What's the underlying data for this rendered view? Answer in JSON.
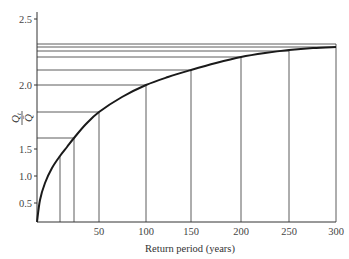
{
  "chart_data": {
    "type": "line",
    "title": "",
    "xlabel": "Return period (years)",
    "ylabel": "Q_t / Q̄",
    "ylabel_parts": {
      "numerator": "Q",
      "numerator_sub": "t",
      "denominator": "Q̄"
    },
    "x_ticks": [
      50,
      100,
      150,
      200,
      250,
      300
    ],
    "y_ticks": [
      0.5,
      1.0,
      1.5,
      2.0,
      2.5
    ],
    "x_tick_labels": [
      "50",
      "100",
      "150",
      "200",
      "250",
      "300"
    ],
    "y_tick_labels": [
      "0.5",
      "1.0",
      "1.5",
      "2.0",
      "2.5"
    ],
    "xlim": [
      0,
      300
    ],
    "ylim": [
      0.3,
      2.5
    ],
    "grid": false,
    "legend": null,
    "series": [
      {
        "name": "Growth curve",
        "x": [
          1,
          10,
          25,
          50,
          100,
          150,
          200,
          250,
          300
        ],
        "y": [
          0.3,
          1.37,
          1.59,
          1.79,
          2.0,
          2.11,
          2.21,
          2.26,
          2.29
        ]
      }
    ],
    "reference_lines": {
      "vertical_x": [
        10,
        25,
        50,
        100,
        150,
        200,
        250,
        300
      ],
      "horizontal_y": [
        1.59,
        1.79,
        2.0,
        2.11,
        2.21,
        2.26,
        2.29,
        2.31
      ]
    }
  },
  "geometry": {
    "origin": [
      37,
      222
    ],
    "x_px": {
      "50": 99,
      "100": 146,
      "150": 191,
      "200": 241,
      "250": 289,
      "300": 336
    },
    "y_px": {
      "0.5": 203,
      "1.0": 176,
      "1.5": 149,
      "2.0": 85,
      "2.5": 19
    },
    "axis_top": 12,
    "axis_right": 336,
    "curve_points": [
      [
        37,
        222
      ],
      [
        40,
        200
      ],
      [
        45,
        183
      ],
      [
        52,
        168
      ],
      [
        60,
        156
      ],
      [
        67,
        147
      ],
      [
        74,
        138
      ],
      [
        86,
        124
      ],
      [
        99,
        112
      ],
      [
        122,
        97
      ],
      [
        146,
        85
      ],
      [
        168,
        77
      ],
      [
        191,
        70
      ],
      [
        216,
        63
      ],
      [
        241,
        57
      ],
      [
        265,
        53
      ],
      [
        289,
        50
      ],
      [
        313,
        48
      ],
      [
        336,
        47
      ]
    ],
    "verticals": [
      {
        "x": 60,
        "top": 156
      },
      {
        "x": 74,
        "top": 138
      },
      {
        "x": 99,
        "top": 112
      },
      {
        "x": 146,
        "top": 85
      },
      {
        "x": 191,
        "top": 70
      },
      {
        "x": 241,
        "top": 57
      },
      {
        "x": 289,
        "top": 51
      },
      {
        "x": 336,
        "top": 44
      }
    ],
    "horizontals": [
      {
        "y": 138,
        "right": 74
      },
      {
        "y": 112,
        "right": 99
      },
      {
        "y": 85,
        "right": 146
      },
      {
        "y": 70,
        "right": 191
      },
      {
        "y": 57,
        "right": 241
      },
      {
        "y": 51,
        "right": 289
      },
      {
        "y": 47,
        "right": 336
      },
      {
        "y": 44,
        "right": 336
      }
    ]
  },
  "colors": {
    "line": "#333333",
    "curve": "#1a1a1a",
    "text": "#444444",
    "background": "#ffffff"
  }
}
